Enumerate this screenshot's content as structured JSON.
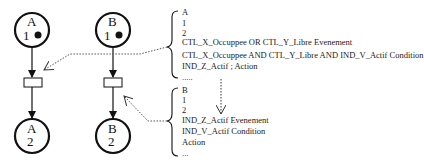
{
  "diagram": {
    "type": "petri-net",
    "places": [
      {
        "id": "A1",
        "name": "A",
        "index": "1",
        "token": true
      },
      {
        "id": "B1",
        "name": "B",
        "index": "1",
        "token": true
      },
      {
        "id": "A2",
        "name": "A",
        "index": "2",
        "token": false
      },
      {
        "id": "B2",
        "name": "B",
        "index": "2",
        "token": false
      }
    ],
    "transitions": [
      {
        "id": "TA",
        "from": "A1",
        "to": "A2"
      },
      {
        "id": "TB",
        "from": "B1",
        "to": "B2"
      }
    ],
    "annotations": [
      {
        "target": "TA",
        "lines": [
          "A",
          "1",
          "2",
          "CTL_X_Occuppee OR CTL_Y_Libre Evenement",
          "CTL_X_Occuppee AND CTL_Y_Libre AND IND_V_Actif Condition",
          "IND_Z_Actif ; Action",
          "....."
        ]
      },
      {
        "target": "TB",
        "lines": [
          "B",
          "1",
          "2",
          "IND_Z_Actif Evenement",
          "IND_V_Actif Condition",
          "Action",
          "..."
        ]
      }
    ]
  }
}
